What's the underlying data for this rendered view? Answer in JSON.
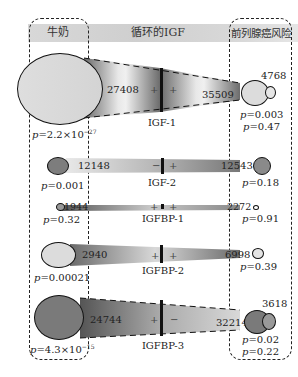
{
  "header": {
    "left_label": "牛奶",
    "center_label": "循环的IGF",
    "right_label": "前列腺癌风险"
  },
  "rows": [
    {
      "name": "IGF-1",
      "left_n": "27408",
      "right_n": "35509",
      "right_n2": "4768",
      "left_sign": "+",
      "right_sign": "+",
      "left_p": "2.2×10",
      "left_p_exp": "−27",
      "right_p": "0.003",
      "right_p2": "0.47"
    },
    {
      "name": "IGF-2",
      "left_n": "12148",
      "right_n": "12543",
      "left_sign": "−",
      "right_sign": "+",
      "left_p": "0.001",
      "right_p": "0.18"
    },
    {
      "name": "IGFBP-1",
      "left_n": "1944",
      "right_n": "2272",
      "left_sign": "+",
      "right_sign": "+",
      "left_p": "0.32",
      "right_p": "0.91"
    },
    {
      "name": "IGFBP-2",
      "left_n": "2940",
      "right_n": "6998",
      "left_sign": "+",
      "right_sign": "+",
      "left_p": "0.00021",
      "right_p": "0.39"
    },
    {
      "name": "IGFBP-3",
      "left_n": "24744",
      "right_n": "32214",
      "right_n2": "3618",
      "left_sign": "+",
      "right_sign": "−",
      "left_p": "4.3×10",
      "left_p_exp": "−15",
      "right_p": "0.02",
      "right_p2": "0.22"
    }
  ],
  "p_prefix": "p",
  "colors": {
    "header": "#d6d6d6",
    "igf1_left": "#dcdcdc",
    "igf2_left": "#7d7d7d",
    "igfbp3_left": "#7a7a7a",
    "outline": "#111111"
  }
}
